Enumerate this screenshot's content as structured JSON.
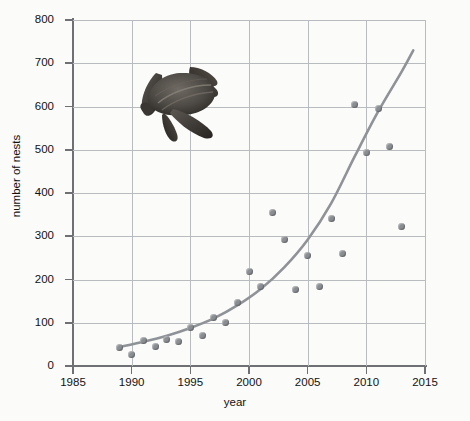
{
  "chart_data": {
    "type": "scatter",
    "title": "",
    "xlabel": "year",
    "ylabel": "number of nests",
    "xlim": [
      1985,
      2015
    ],
    "ylim": [
      0,
      800
    ],
    "xticks": [
      1985,
      1990,
      1995,
      2000,
      2005,
      2010,
      2015
    ],
    "yticks": [
      0,
      100,
      200,
      300,
      400,
      500,
      600,
      700,
      800
    ],
    "grid": true,
    "legend": null,
    "x": [
      1989,
      1990,
      1991,
      1992,
      1993,
      1994,
      1995,
      1996,
      1997,
      1998,
      1999,
      2000,
      2001,
      2002,
      2003,
      2004,
      2005,
      2006,
      2007,
      2008,
      2009,
      2010,
      2011,
      2012,
      2013
    ],
    "values": [
      42,
      26,
      58,
      45,
      61,
      56,
      88,
      70,
      112,
      100,
      147,
      218,
      183,
      355,
      292,
      176,
      255,
      183,
      340,
      260,
      605,
      494,
      595,
      508,
      322
    ],
    "series": [
      {
        "name": "nest counts",
        "values": [
          42,
          26,
          58,
          45,
          61,
          56,
          88,
          70,
          112,
          100,
          147,
          218,
          183,
          355,
          292,
          176,
          255,
          183,
          340,
          260,
          605,
          494,
          595,
          508,
          322
        ]
      },
      {
        "name": "exponential trend",
        "type": "line",
        "x": [
          1989,
          1991,
          1993,
          1995,
          1997,
          1999,
          2001,
          2003,
          2005,
          2007,
          2009,
          2011,
          2013,
          2014
        ],
        "values": [
          44,
          56,
          70,
          88,
          110,
          140,
          178,
          228,
          292,
          376,
          484,
          588,
          680,
          730
        ]
      }
    ],
    "annotations": [
      {
        "name": "turtle-photo",
        "description": "leatherback sea turtle photograph"
      }
    ]
  },
  "axes": {
    "y_labels": [
      "800",
      "700",
      "600",
      "500",
      "400",
      "300",
      "200",
      "100",
      "0"
    ],
    "x_labels": [
      "1985",
      "1990",
      "1995",
      "2000",
      "2005",
      "2010",
      "2015"
    ],
    "y_title": "number of nests",
    "x_title": "year"
  },
  "colors": {
    "background": "#fbfbfa",
    "grid": "#b9bcbe",
    "axis": "#6e7073",
    "point": "#8a8d91",
    "curve": "#8f9296",
    "text": "#111214"
  }
}
